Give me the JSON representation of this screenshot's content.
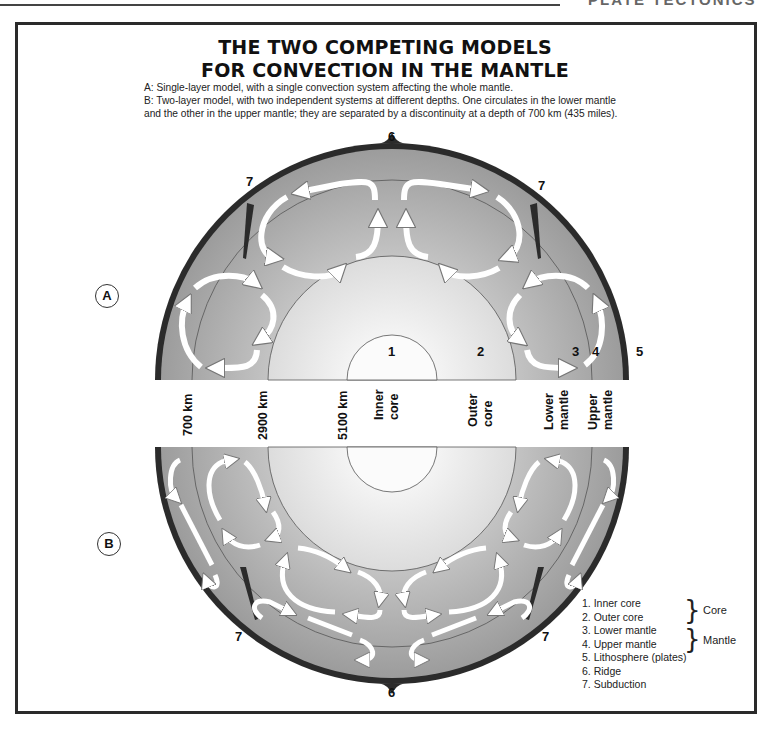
{
  "page_header": {
    "cut_title": "PLATE TECTONICS"
  },
  "title": {
    "line1": "THE TWO COMPETING MODELS",
    "line2": "FOR CONVECTION IN THE MANTLE"
  },
  "description": {
    "a": "A: Single-layer model, with a single convection system affecting the whole mantle.",
    "b1": "B: Two-layer model, with two independent systems at different depths. One circulates in the lower mantle",
    "b2": "and the other in the upper mantle; they are separated by a discontinuity at a depth of 700 km (435 miles)."
  },
  "models": {
    "a": {
      "badge": "A"
    },
    "b": {
      "badge": "B"
    }
  },
  "callouts": {
    "n1": "1",
    "n2": "2",
    "n3": "3",
    "n4": "4",
    "n5": "5",
    "n6": "6",
    "n7": "7"
  },
  "depth_band": {
    "labels": [
      {
        "line1": "700 km",
        "line2": ""
      },
      {
        "line1": "2900 km",
        "line2": ""
      },
      {
        "line1": "5100 km",
        "line2": ""
      },
      {
        "line1": "Inner",
        "line2": "core"
      },
      {
        "line1": "Outer",
        "line2": "core"
      },
      {
        "line1": "Lower",
        "line2": "mantle"
      },
      {
        "line1": "Upper",
        "line2": "mantle"
      }
    ]
  },
  "legend": {
    "items": [
      "1. Inner core",
      "2. Outer core",
      "3. Lower mantle",
      "4. Upper mantle",
      "5. Lithosphere (plates)",
      "6. Ridge",
      "7. Subduction"
    ],
    "groups": {
      "core": "Core",
      "mantle": "Mantle"
    }
  },
  "colors": {
    "frame": "#2a2a2a",
    "lithosphere": "#2b2b2b",
    "mantle_outer": "#9e9e9e",
    "mantle_inner": "#c4c4c4",
    "outer_core_edge": "#d8d8d8",
    "outer_core_center": "#f4f4f4",
    "inner_core": "#fbfbfb",
    "arrow": "#ffffff",
    "boundary_line": "#555555"
  }
}
